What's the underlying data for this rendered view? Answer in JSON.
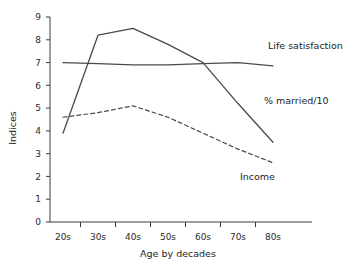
{
  "chart_data": {
    "type": "line",
    "title": "",
    "xlabel": "Age by decades",
    "ylabel": "Indices",
    "categories": [
      "20s",
      "30s",
      "40s",
      "50s",
      "60s",
      "70s",
      "80s"
    ],
    "xlim": [
      0,
      6
    ],
    "ylim": [
      0,
      9
    ],
    "yticks": [
      "0",
      "1",
      "2",
      "3",
      "4",
      "5",
      "6",
      "7",
      "8",
      "9"
    ],
    "grid": false,
    "legend_position": "inline-right-annotations",
    "series": [
      {
        "name": "Life satisfaction",
        "style": "solid",
        "values": [
          7.0,
          6.95,
          6.9,
          6.9,
          6.95,
          7.0,
          6.85
        ],
        "label": "Life satisfaction"
      },
      {
        "name": "% married/10",
        "style": "solid",
        "values": [
          3.9,
          8.2,
          8.5,
          7.8,
          7.0,
          5.2,
          3.5
        ],
        "label": "% married/10"
      },
      {
        "name": "Income",
        "style": "dashed",
        "values": [
          4.6,
          4.8,
          5.1,
          4.6,
          3.9,
          3.2,
          2.6
        ],
        "label": "Income"
      }
    ],
    "annotations": [
      {
        "text": "Life satisfaction",
        "series": "Life satisfaction"
      },
      {
        "text": "% married/10",
        "series": "% married/10"
      },
      {
        "text": "Income",
        "series": "Income"
      }
    ]
  },
  "axis": {
    "y_title": "Indices",
    "x_title": "Age by decades",
    "y_tick_0": "0",
    "y_tick_1": "1",
    "y_tick_2": "2",
    "y_tick_3": "3",
    "y_tick_4": "4",
    "y_tick_5": "5",
    "y_tick_6": "6",
    "y_tick_7": "7",
    "y_tick_8": "8",
    "y_tick_9": "9",
    "x_tick_0": "20s",
    "x_tick_1": "30s",
    "x_tick_2": "40s",
    "x_tick_3": "50s",
    "x_tick_4": "60s",
    "x_tick_5": "70s",
    "x_tick_6": "80s"
  },
  "labels": {
    "life_satisfaction": "Life satisfaction",
    "married": "% married/10",
    "income": "Income"
  },
  "colors": {
    "line": "#4a4a4a",
    "axis": "#3a3a3a",
    "text": "#1d1d1d",
    "background": "#ffffff"
  }
}
